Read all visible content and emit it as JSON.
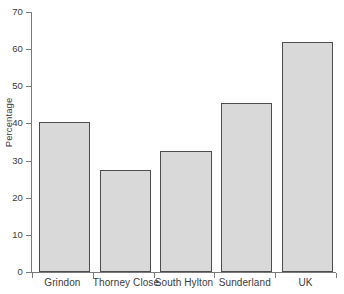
{
  "chart_data": {
    "type": "bar",
    "title": "",
    "xlabel": "",
    "ylabel": "Percentage",
    "categories": [
      "Grindon",
      "Thorney Close",
      "South Hylton",
      "Sunderland",
      "UK"
    ],
    "values": [
      40.5,
      27.5,
      32.5,
      45.5,
      62
    ],
    "ylim": [
      0,
      70
    ],
    "yticks": [
      0,
      10,
      20,
      30,
      40,
      50,
      60,
      70
    ],
    "ytick_labels": [
      "0",
      "10",
      "20",
      "30",
      "40",
      "50",
      "60",
      "70"
    ],
    "grid": false,
    "legend": null,
    "bar_fill_color": "#d9d9d9",
    "bar_border_color": "#4d4d4d",
    "axis_color": "#7a7a7a",
    "background_color": "#ffffff",
    "text_color": "#3b3b3b"
  }
}
